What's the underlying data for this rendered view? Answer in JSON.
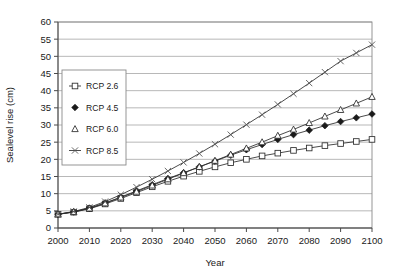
{
  "chart_data": {
    "type": "line",
    "title": "",
    "xlabel": "Year",
    "ylabel": "Sealevel rise (cm)",
    "xlim": [
      2000,
      2100
    ],
    "ylim": [
      0,
      60
    ],
    "ytick_step": 5,
    "xtick_step": 10,
    "grid": "horizontal",
    "legend_position": "upper-left-inside",
    "x": [
      2000,
      2005,
      2010,
      2015,
      2020,
      2025,
      2030,
      2035,
      2040,
      2045,
      2050,
      2055,
      2060,
      2065,
      2070,
      2075,
      2080,
      2085,
      2090,
      2095,
      2100
    ],
    "xtick_labels": [
      "2000",
      "2010",
      "2020",
      "2030",
      "2040",
      "2050",
      "2060",
      "2070",
      "2080",
      "2090",
      "2100"
    ],
    "ytick_labels": [
      "0",
      "5",
      "10",
      "15",
      "20",
      "25",
      "30",
      "35",
      "40",
      "45",
      "50",
      "55",
      "60"
    ],
    "series": [
      {
        "name": "RCP 2.6",
        "marker": "open-square",
        "values": [
          4.0,
          4.6,
          5.6,
          7.0,
          8.6,
          10.3,
          12.0,
          13.6,
          15.1,
          16.5,
          17.8,
          19.0,
          20.0,
          21.0,
          21.8,
          22.6,
          23.3,
          24.0,
          24.6,
          25.2,
          25.8
        ]
      },
      {
        "name": "RCP 4.5",
        "marker": "solid-diamond",
        "values": [
          4.0,
          4.7,
          5.8,
          7.3,
          9.0,
          10.8,
          12.6,
          14.4,
          16.1,
          17.8,
          19.5,
          21.2,
          22.8,
          24.3,
          25.8,
          27.2,
          28.5,
          29.8,
          31.0,
          32.1,
          33.2
        ]
      },
      {
        "name": "RCP 6.0",
        "marker": "open-triangle",
        "values": [
          4.0,
          4.7,
          5.7,
          7.2,
          8.9,
          10.6,
          12.4,
          14.2,
          16.0,
          17.8,
          19.6,
          21.4,
          23.2,
          25.0,
          26.9,
          28.7,
          30.6,
          32.5,
          34.4,
          36.3,
          38.2
        ]
      },
      {
        "name": "RCP 8.5",
        "marker": "cross-x",
        "values": [
          4.0,
          4.8,
          6.0,
          7.7,
          9.7,
          11.9,
          14.2,
          16.6,
          19.1,
          21.7,
          24.4,
          27.2,
          30.1,
          33.0,
          36.0,
          39.1,
          42.2,
          45.4,
          48.6,
          51.0,
          53.4
        ]
      }
    ]
  },
  "legend": {
    "entries": [
      {
        "label": "RCP 2.6"
      },
      {
        "label": "RCP 4.5"
      },
      {
        "label": "RCP 6.0"
      },
      {
        "label": "RCP 8.5"
      }
    ]
  },
  "colors": {
    "line": "#2b2b2b",
    "grid": "#9a9a9a",
    "frame": "#8a8a8a",
    "text": "#1a1a1a",
    "background": "#ffffff"
  }
}
